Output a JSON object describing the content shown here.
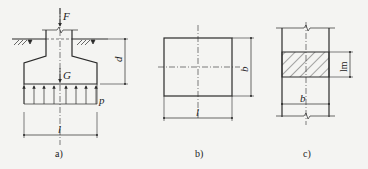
{
  "figure": {
    "panels": [
      {
        "id": "a",
        "caption": "a)",
        "labels": {
          "force": "F",
          "weight": "G",
          "pressure": "p",
          "depth": "d",
          "length": "l"
        }
      },
      {
        "id": "b",
        "caption": "b)",
        "labels": {
          "width": "b",
          "length": "l"
        }
      },
      {
        "id": "c",
        "caption": "c)",
        "labels": {
          "strip": "lm",
          "width": "b"
        }
      }
    ],
    "colors": {
      "line": "#2a2a2a",
      "background": "#f4f4f2"
    }
  }
}
